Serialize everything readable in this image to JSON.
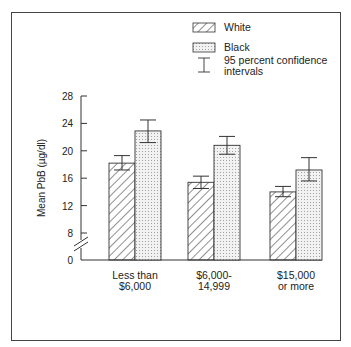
{
  "chart_data": {
    "type": "bar",
    "title": "",
    "xlabel": "",
    "ylabel": "Mean PbB (µg/dl)",
    "categories": [
      [
        "Less than",
        "$6,000"
      ],
      [
        "$6,000-",
        "14,999"
      ],
      [
        "$15,000",
        "or more"
      ]
    ],
    "series": [
      {
        "name": "White",
        "pattern": "hatch",
        "values": [
          18.2,
          15.4,
          14.0
        ],
        "ci_low": [
          17.2,
          14.5,
          13.3
        ],
        "ci_high": [
          19.3,
          16.3,
          14.8
        ]
      },
      {
        "name": "Black",
        "pattern": "dots",
        "values": [
          22.9,
          20.8,
          17.2
        ],
        "ci_low": [
          21.2,
          19.5,
          15.6
        ],
        "ci_high": [
          24.5,
          22.1,
          19.0
        ]
      }
    ],
    "yticks": [
      0,
      8,
      12,
      16,
      20,
      24,
      28
    ],
    "ylim": [
      0,
      28
    ],
    "axis_break": "between 0 and 8",
    "grid": false,
    "legend": {
      "placement": "top-right",
      "entries": [
        "White",
        "Black"
      ],
      "ci_label": "95 percent confidence intervals",
      "ci_label_lines": [
        "95 percent confidence",
        "intervals"
      ]
    }
  }
}
